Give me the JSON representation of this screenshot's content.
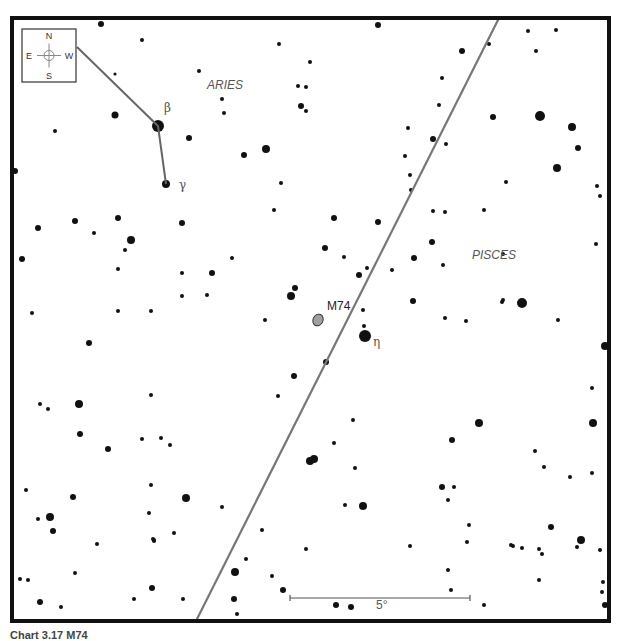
{
  "chart_data": {
    "type": "scatter",
    "frame": {
      "x": 12,
      "y": 18,
      "w": 597,
      "h": 603,
      "border": 4
    },
    "compass": {
      "N": "N",
      "S": "S",
      "E": "E",
      "W": "W",
      "box": {
        "x": 22,
        "y": 29,
        "w": 54,
        "h": 53
      }
    },
    "constellation_labels": [
      {
        "text": "ARIES",
        "x": 207,
        "y": 89
      },
      {
        "text": "PISCES",
        "x": 472,
        "y": 259
      }
    ],
    "star_labels": [
      {
        "text": "β",
        "x": 164,
        "y": 112
      },
      {
        "text": "γ",
        "x": 179,
        "y": 189
      },
      {
        "text": "η",
        "x": 373,
        "y": 346
      }
    ],
    "object": {
      "name": "M74",
      "label_x": 327,
      "label_y": 310,
      "x": 318,
      "y": 320,
      "rx": 5,
      "ry": 6,
      "fill": "#a0a0a0"
    },
    "ecliptic": {
      "x1": 499,
      "y1": 18,
      "x2": 196,
      "y2": 621,
      "color": "#777777"
    },
    "constellation_lines": [
      [
        [
          77,
          47
        ],
        [
          158,
          126
        ],
        [
          166,
          184
        ]
      ]
    ],
    "scale_bar": {
      "x1": 290,
      "x2": 470,
      "y": 598,
      "label": "5°"
    },
    "stars": [
      [
        101,
        24,
        3
      ],
      [
        142,
        40,
        2
      ],
      [
        115,
        74,
        1.6
      ],
      [
        158,
        126,
        6
      ],
      [
        166,
        184,
        4
      ],
      [
        115,
        115,
        3.5
      ],
      [
        55,
        131,
        2
      ],
      [
        15,
        171,
        3
      ],
      [
        279,
        44,
        2
      ],
      [
        310,
        62,
        2
      ],
      [
        199,
        71,
        2
      ],
      [
        298,
        86,
        2
      ],
      [
        306,
        87,
        2
      ],
      [
        301,
        106,
        3
      ],
      [
        306,
        111,
        2
      ],
      [
        222,
        99,
        2
      ],
      [
        224,
        113,
        2
      ],
      [
        189,
        138,
        3
      ],
      [
        244,
        155,
        3
      ],
      [
        266,
        149,
        4
      ],
      [
        281,
        183,
        2
      ],
      [
        378,
        25,
        3
      ],
      [
        442,
        78,
        2
      ],
      [
        462,
        51,
        3
      ],
      [
        439,
        105,
        2
      ],
      [
        408,
        128,
        2
      ],
      [
        433,
        139,
        3
      ],
      [
        405,
        156,
        2
      ],
      [
        410,
        175,
        2
      ],
      [
        411,
        190,
        2
      ],
      [
        528,
        31,
        2
      ],
      [
        556,
        30,
        2
      ],
      [
        489,
        44,
        2
      ],
      [
        536,
        51,
        2
      ],
      [
        540,
        116,
        5
      ],
      [
        493,
        117,
        3
      ],
      [
        572,
        127,
        4
      ],
      [
        446,
        144,
        2
      ],
      [
        578,
        148,
        3
      ],
      [
        506,
        182,
        2
      ],
      [
        557,
        168,
        4
      ],
      [
        597,
        186,
        2
      ],
      [
        600,
        196,
        2
      ],
      [
        38,
        228,
        3
      ],
      [
        75,
        221,
        3
      ],
      [
        118,
        218,
        3
      ],
      [
        94,
        233,
        2
      ],
      [
        131,
        240,
        4
      ],
      [
        125,
        250,
        2
      ],
      [
        182,
        223,
        3
      ],
      [
        22,
        259,
        3
      ],
      [
        118,
        269,
        2
      ],
      [
        182,
        273,
        2
      ],
      [
        212,
        273,
        3
      ],
      [
        232,
        258,
        2
      ],
      [
        207,
        295,
        2
      ],
      [
        32,
        313,
        2
      ],
      [
        118,
        311,
        2
      ],
      [
        151,
        311,
        2
      ],
      [
        182,
        296,
        2
      ],
      [
        274,
        210,
        2
      ],
      [
        334,
        218,
        3
      ],
      [
        378,
        222,
        3
      ],
      [
        325,
        248,
        3
      ],
      [
        344,
        257,
        2
      ],
      [
        359,
        275,
        3
      ],
      [
        367,
        268,
        2
      ],
      [
        392,
        270,
        2
      ],
      [
        295,
        288,
        3
      ],
      [
        291,
        296,
        4
      ],
      [
        265,
        320,
        2
      ],
      [
        363,
        310,
        2
      ],
      [
        364,
        326,
        2
      ],
      [
        365,
        336,
        6
      ],
      [
        326,
        362,
        3
      ],
      [
        294,
        376,
        3
      ],
      [
        414,
        258,
        3
      ],
      [
        445,
        212,
        2
      ],
      [
        433,
        211,
        2
      ],
      [
        484,
        210,
        2
      ],
      [
        432,
        242,
        3
      ],
      [
        443,
        265,
        2
      ],
      [
        503,
        254,
        2
      ],
      [
        413,
        301,
        3
      ],
      [
        502,
        302,
        2
      ],
      [
        596,
        244,
        2
      ],
      [
        445,
        318,
        2
      ],
      [
        466,
        321,
        2
      ],
      [
        522,
        303,
        5
      ],
      [
        503,
        300,
        2
      ],
      [
        558,
        320,
        2
      ],
      [
        605,
        346,
        4
      ],
      [
        89,
        343,
        3
      ],
      [
        40,
        404,
        2
      ],
      [
        48,
        409,
        2
      ],
      [
        79,
        404,
        4
      ],
      [
        151,
        395,
        2
      ],
      [
        80,
        434,
        3
      ],
      [
        108,
        449,
        3
      ],
      [
        142,
        439,
        2
      ],
      [
        161,
        438,
        2
      ],
      [
        170,
        445,
        2
      ],
      [
        26,
        490,
        2
      ],
      [
        73,
        497,
        3
      ],
      [
        50,
        517,
        4
      ],
      [
        53,
        531,
        3
      ],
      [
        38,
        519,
        2
      ],
      [
        97,
        544,
        2
      ],
      [
        151,
        485,
        2
      ],
      [
        186,
        498,
        4
      ],
      [
        149,
        513,
        2
      ],
      [
        153,
        539,
        2
      ],
      [
        174,
        533,
        2
      ],
      [
        154,
        541,
        2
      ],
      [
        154,
        540,
        2
      ],
      [
        278,
        396,
        2
      ],
      [
        353,
        420,
        2
      ],
      [
        334,
        443,
        2
      ],
      [
        310,
        461,
        4
      ],
      [
        314,
        459,
        4
      ],
      [
        355,
        468,
        2
      ],
      [
        345,
        505,
        2
      ],
      [
        363,
        506,
        4
      ],
      [
        222,
        507,
        2
      ],
      [
        262,
        530,
        2
      ],
      [
        306,
        549,
        2
      ],
      [
        246,
        559,
        2
      ],
      [
        452,
        440,
        3
      ],
      [
        479,
        423,
        4
      ],
      [
        535,
        451,
        2
      ],
      [
        544,
        467,
        2
      ],
      [
        592,
        388,
        2
      ],
      [
        593,
        423,
        4
      ],
      [
        570,
        477,
        2
      ],
      [
        592,
        473,
        2
      ],
      [
        442,
        487,
        3
      ],
      [
        454,
        487,
        2
      ],
      [
        448,
        500,
        2
      ],
      [
        469,
        525,
        2
      ],
      [
        511,
        545,
        2
      ],
      [
        522,
        548,
        2
      ],
      [
        551,
        527,
        3
      ],
      [
        577,
        547,
        2
      ],
      [
        581,
        540,
        4
      ],
      [
        600,
        550,
        2
      ],
      [
        410,
        546,
        2
      ],
      [
        467,
        542,
        2
      ],
      [
        513,
        546,
        2
      ],
      [
        539,
        549,
        2
      ],
      [
        542,
        554,
        2
      ],
      [
        20,
        579,
        2
      ],
      [
        28,
        580,
        2
      ],
      [
        75,
        573,
        2
      ],
      [
        40,
        602,
        3
      ],
      [
        61,
        607,
        2
      ],
      [
        134,
        599,
        2
      ],
      [
        152,
        588,
        3
      ],
      [
        183,
        599,
        2
      ],
      [
        235,
        572,
        4
      ],
      [
        234,
        599,
        3
      ],
      [
        272,
        576,
        2
      ],
      [
        283,
        590,
        3
      ],
      [
        336,
        605,
        3
      ],
      [
        351,
        607,
        3
      ],
      [
        448,
        570,
        2
      ],
      [
        451,
        590,
        2
      ],
      [
        484,
        605,
        2
      ],
      [
        539,
        580,
        2
      ],
      [
        603,
        582,
        2
      ],
      [
        602,
        592,
        2
      ],
      [
        605,
        605,
        3
      ],
      [
        237,
        614,
        2
      ]
    ]
  },
  "caption": "Chart 3.17 M74"
}
